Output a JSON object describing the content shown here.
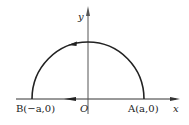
{
  "diagram": {
    "type": "semicircle-contour",
    "axes": {
      "x_label": "x",
      "y_label": "y",
      "origin_label": "O"
    },
    "points": [
      {
        "name": "B",
        "label": "B(−a,0)"
      },
      {
        "name": "A",
        "label": "A(a,0)"
      }
    ],
    "curve": "upper semicircle of radius a centered at O",
    "orientation": "counterclockwise: along arc from A to B, then along x-axis from B back",
    "colors": {
      "stroke": "#222222",
      "background": "#ffffff"
    }
  }
}
